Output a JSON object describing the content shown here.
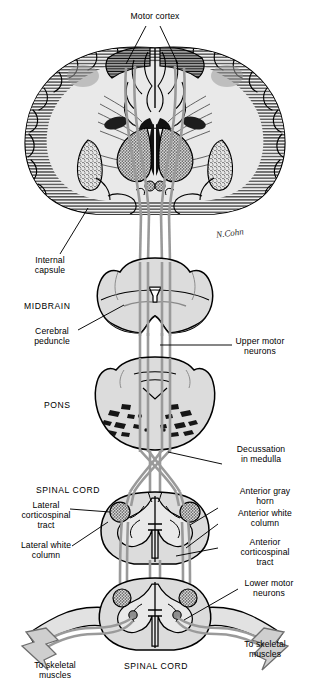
{
  "figure": {
    "signature": "N.Cohn"
  },
  "colors": {
    "ink": "#000000",
    "tract": "#9a9a9a",
    "tract_dark": "#7d7d7d",
    "tissue_light": "#e4e4e4",
    "tissue_mid": "#c9c9c9",
    "tissue_dark": "#a8a8a8",
    "ventricle": "#111111",
    "background": "#ffffff"
  },
  "labels": {
    "motor_cortex": "Motor cortex",
    "internal_capsule": "Internal\ncapsule",
    "midbrain": "MIDBRAIN",
    "cerebral_peduncle": "Cerebral\npeduncle",
    "upper_motor_neurons": "Upper motor\nneurons",
    "pons": "PONS",
    "decussation": "Decussation\nin medulla",
    "spinal_cord_upper": "SPINAL CORD",
    "lateral_corticospinal_tract": "Lateral\ncorticospinal\ntract",
    "lateral_white_column": "Lateral white\ncolumn",
    "anterior_gray_horn": "Anterior gray\nhorn",
    "anterior_white_column": "Anterior white\ncolumn",
    "anterior_corticospinal_tract": "Anterior\ncorticospinal\ntract",
    "lower_motor_neurons": "Lower motor\nneurons",
    "spinal_cord_lower": "SPINAL CORD",
    "to_skeletal_muscles_left": "To skeletal\nmuscles",
    "to_skeletal_muscles_right": "To skeletal\nmuscles"
  },
  "structures": [
    {
      "name": "cerebrum-coronal-section",
      "region": "brain"
    },
    {
      "name": "midbrain-section",
      "region": "brainstem"
    },
    {
      "name": "pons-section",
      "region": "brainstem"
    },
    {
      "name": "medulla-decussation",
      "region": "brainstem"
    },
    {
      "name": "spinal-cord-upper-section",
      "region": "spinal-cord"
    },
    {
      "name": "spinal-cord-lower-section",
      "region": "spinal-cord"
    }
  ]
}
